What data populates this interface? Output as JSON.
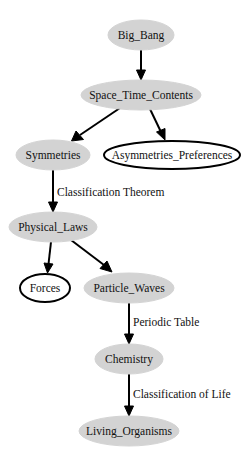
{
  "diagram": {
    "type": "directed-graph",
    "colors": {
      "filled_node": "#d3d3d3",
      "outline_node_stroke": "#000000",
      "edge": "#000000",
      "background": "#ffffff"
    },
    "nodes": [
      {
        "id": "big_bang",
        "label": "Big_Bang",
        "style": "filled"
      },
      {
        "id": "space_time_contents",
        "label": "Space_Time_Contents",
        "style": "filled"
      },
      {
        "id": "symmetries",
        "label": "Symmetries",
        "style": "filled"
      },
      {
        "id": "asymmetries_preferences",
        "label": "Asymmetries_Preferences",
        "style": "outline"
      },
      {
        "id": "physical_laws",
        "label": "Physical_Laws",
        "style": "filled"
      },
      {
        "id": "forces",
        "label": "Forces",
        "style": "outline"
      },
      {
        "id": "particle_waves",
        "label": "Particle_Waves",
        "style": "filled"
      },
      {
        "id": "chemistry",
        "label": "Chemistry",
        "style": "filled"
      },
      {
        "id": "living_organisms",
        "label": "Living_Organisms",
        "style": "filled"
      }
    ],
    "edges": [
      {
        "from": "big_bang",
        "to": "space_time_contents",
        "label": ""
      },
      {
        "from": "space_time_contents",
        "to": "symmetries",
        "label": ""
      },
      {
        "from": "space_time_contents",
        "to": "asymmetries_preferences",
        "label": ""
      },
      {
        "from": "symmetries",
        "to": "physical_laws",
        "label": "Classification Theorem"
      },
      {
        "from": "physical_laws",
        "to": "forces",
        "label": ""
      },
      {
        "from": "physical_laws",
        "to": "particle_waves",
        "label": ""
      },
      {
        "from": "particle_waves",
        "to": "chemistry",
        "label": "Periodic Table"
      },
      {
        "from": "chemistry",
        "to": "living_organisms",
        "label": "Classification of Life"
      }
    ]
  }
}
